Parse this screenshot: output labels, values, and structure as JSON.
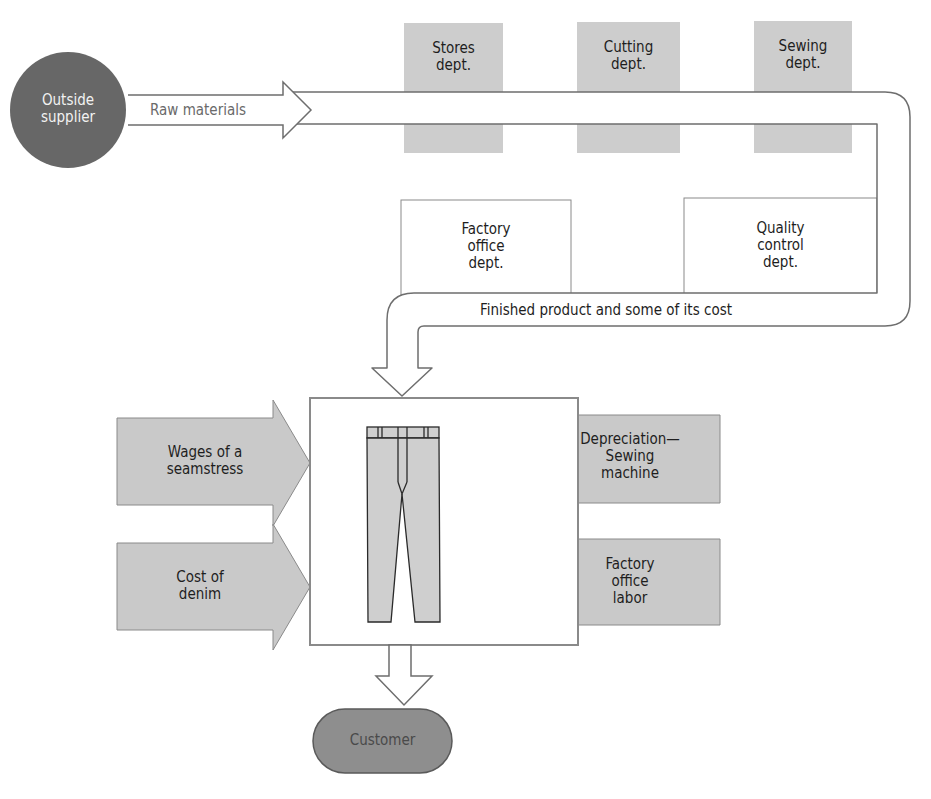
{
  "diagram": {
    "colors": {
      "stroke": "#6e6e6e",
      "dept_fill": "#cdcdcd",
      "input_fill": "#c9c9c9",
      "supplier_fill": "#676767",
      "customer_fill": "#8e8e8e",
      "pants_fill": "#cfcfcf"
    },
    "supplier": {
      "label_line1": "Outside",
      "label_line2": "supplier"
    },
    "raw_materials": {
      "label": "Raw materials"
    },
    "departments": [
      {
        "line1": "Stores",
        "line2": "dept."
      },
      {
        "line1": "Cutting",
        "line2": "dept."
      },
      {
        "line1": "Sewing",
        "line2": "dept."
      }
    ],
    "offices": [
      {
        "line1": "Factory",
        "line2": "office",
        "line3": "dept."
      },
      {
        "line1": "Quality",
        "line2": "control",
        "line3": "dept."
      }
    ],
    "finished_flow": {
      "label": "Finished product and some of its cost"
    },
    "cost_inputs": {
      "left": [
        {
          "line1": "Wages of a",
          "line2": "seamstress"
        },
        {
          "line1": "Cost of",
          "line2": "denim"
        }
      ],
      "right": [
        {
          "line1": "Depreciation—",
          "line2": "Sewing",
          "line3": "machine"
        },
        {
          "line1": "Factory",
          "line2": "office",
          "line3": "labor"
        }
      ]
    },
    "product": {
      "icon": "jeans-icon"
    },
    "customer": {
      "label": "Customer"
    }
  }
}
